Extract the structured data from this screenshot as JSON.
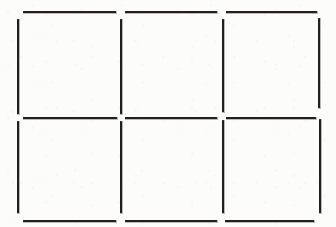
{
  "document": {
    "kind": "line-drawing",
    "title": "Six-cell grid outline",
    "background_color": "#fcfcfb",
    "ink_color": "#231f20",
    "canvas": {
      "width": 336,
      "height": 227
    }
  },
  "diagram": {
    "columns": 3,
    "rows": 2,
    "cell_count": 6,
    "stroke_width": 2,
    "cells": [
      {
        "name": "cell-r1c1",
        "row": 1,
        "column": 1,
        "label": ""
      },
      {
        "name": "cell-r1c2",
        "row": 1,
        "column": 2,
        "label": ""
      },
      {
        "name": "cell-r1c3",
        "row": 1,
        "column": 3,
        "label": ""
      },
      {
        "name": "cell-r2c1",
        "row": 2,
        "column": 1,
        "label": ""
      },
      {
        "name": "cell-r2c2",
        "row": 2,
        "column": 2,
        "label": ""
      },
      {
        "name": "cell-r2c3",
        "row": 2,
        "column": 3,
        "label": ""
      }
    ],
    "horizontal_rules": [
      {
        "name": "top-rule-col1",
        "x": 23,
        "y": 11,
        "length": 93
      },
      {
        "name": "top-rule-col2",
        "x": 125,
        "y": 11,
        "length": 92
      },
      {
        "name": "top-rule-col3",
        "x": 226,
        "y": 11,
        "length": 91
      },
      {
        "name": "middle-rule-col1",
        "x": 23,
        "y": 117,
        "length": 94
      },
      {
        "name": "middle-rule-col2",
        "x": 125,
        "y": 117,
        "length": 92
      },
      {
        "name": "middle-rule-col3",
        "x": 226,
        "y": 117,
        "length": 90
      },
      {
        "name": "bottom-rule-col1",
        "x": 23,
        "y": 220,
        "length": 93
      },
      {
        "name": "bottom-rule-col2",
        "x": 125,
        "y": 220,
        "length": 92
      },
      {
        "name": "bottom-rule-col3",
        "x": 225,
        "y": 220,
        "length": 89
      }
    ],
    "vertical_rules": [
      {
        "name": "left-rule-row1",
        "x": 17,
        "y": 19,
        "length": 95
      },
      {
        "name": "divider1-rule-row1",
        "x": 120,
        "y": 19,
        "length": 95
      },
      {
        "name": "divider2-rule-row1",
        "x": 222,
        "y": 19,
        "length": 93
      },
      {
        "name": "right-rule-row1",
        "x": 318,
        "y": 18,
        "length": 90
      },
      {
        "name": "left-rule-row2",
        "x": 17,
        "y": 121,
        "length": 92
      },
      {
        "name": "divider1-rule-row2",
        "x": 120,
        "y": 121,
        "length": 92
      },
      {
        "name": "divider2-rule-row2",
        "x": 222,
        "y": 120,
        "length": 93
      },
      {
        "name": "right-rule-row2",
        "x": 319,
        "y": 119,
        "length": 94
      }
    ]
  }
}
